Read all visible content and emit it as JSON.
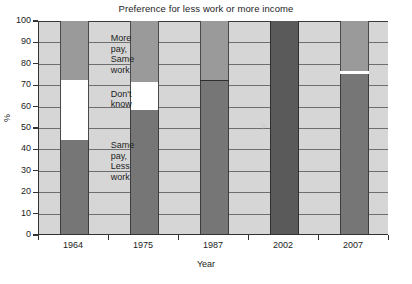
{
  "chart_data": {
    "type": "bar",
    "title": "Preference for less work or more income",
    "xlabel": "Year",
    "ylabel": "%",
    "categories": [
      "1964",
      "1975",
      "1987",
      "2002",
      "2007"
    ],
    "ylim": [
      0,
      100
    ],
    "yticks": [
      0,
      10,
      20,
      30,
      40,
      50,
      60,
      70,
      80,
      90,
      100
    ],
    "grid": true,
    "legend": "none",
    "stacked": true,
    "series": [
      {
        "name": "Same pay, Less work",
        "color": "#767676",
        "values": [
          44,
          58,
          71.5,
          null,
          75
        ]
      },
      {
        "name": "Don't know",
        "color": "#ffffff",
        "values": [
          28,
          13,
          0,
          null,
          0
        ]
      },
      {
        "name": "More pay, Same work",
        "color": "#9a9a9a",
        "values": [
          28,
          29,
          28.5,
          null,
          25
        ]
      },
      {
        "name": "No data",
        "color": "#5a5a5a",
        "values": [
          null,
          null,
          null,
          100,
          null
        ]
      }
    ],
    "annotations": [
      {
        "id": "more-pay-same-work",
        "text": "More\npay,\nSame\nwork",
        "x_pct": 20.5,
        "y_pct": 92
      },
      {
        "id": "dont-know",
        "text": "Don't\nknow",
        "x_pct": 20.5,
        "y_pct": 66
      },
      {
        "id": "same-pay-less-work",
        "text": "Same\npay,\nLess\nwork",
        "x_pct": 20.5,
        "y_pct": 42
      },
      {
        "id": "missing-data-marker",
        "text": "?",
        "x_pct": 64,
        "y_pct": 50
      }
    ],
    "plot_background": "#d6d6d6"
  },
  "colors": {
    "plot_background": "#d6d6d6",
    "more_pay_same_work": "#9a9a9a",
    "dont_know": "#ffffff",
    "same_pay_less_work": "#767676",
    "no_data": "#5a5a5a",
    "axis": "#333333",
    "gridline": "#6e6e6e",
    "text": "#1d1d1d"
  }
}
